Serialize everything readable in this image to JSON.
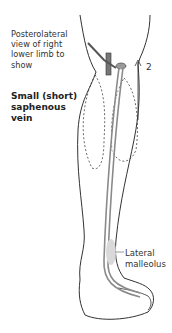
{
  "caption": [
    "Posterolateral",
    "view of right",
    "lower limb to",
    "show"
  ],
  "title": [
    "Small (short)",
    "saphenous",
    "vein"
  ],
  "label_number": "2",
  "label_lateral_malleolus": [
    "Lateral",
    "malleolus"
  ],
  "colors": {
    "outline": "#333333",
    "vein": "#8a8a8a",
    "malleolus": "#d9d9d9"
  }
}
